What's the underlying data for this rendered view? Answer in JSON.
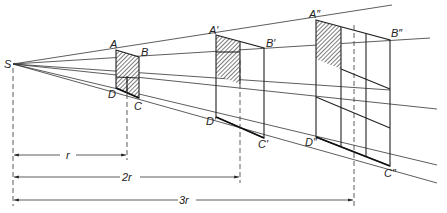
{
  "figure": {
    "colors": {
      "line": "#222222",
      "hatch": "#555555",
      "background": "#ffffff"
    }
  },
  "labels": {
    "center": "S",
    "quad1": {
      "A": "A",
      "B": "B",
      "C": "C",
      "D": "D"
    },
    "quad2": {
      "A": "A′",
      "B": "B′",
      "C": "C′",
      "D": "D′"
    },
    "quad3": {
      "A": "A″",
      "B": "B″",
      "C": "C″",
      "D": "D″"
    }
  },
  "dimensions": [
    {
      "label": "r"
    },
    {
      "label": "2r"
    },
    {
      "label": "3r"
    }
  ]
}
